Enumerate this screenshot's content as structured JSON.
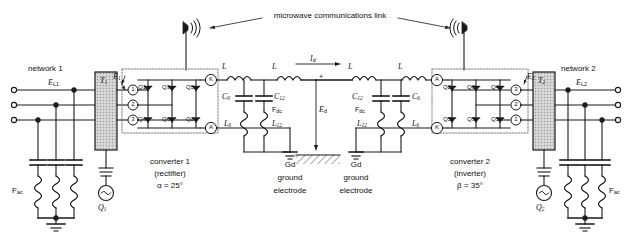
{
  "diagram": {
    "link_label": "microwave communications link"
  },
  "networks": {
    "left": {
      "name": "network 1",
      "line_voltage": "E",
      "line_voltage_sub": "L1",
      "transformer": "T",
      "transformer_sub": "1",
      "converter_voltage": "E",
      "converter_voltage_sub": "1",
      "ac_filter": "F",
      "ac_filter_sub": "ac",
      "source": "Q",
      "source_sub": "1"
    },
    "right": {
      "name": "network 2",
      "line_voltage": "E",
      "line_voltage_sub": "L2",
      "transformer": "T",
      "transformer_sub": "2",
      "converter_voltage": "E",
      "converter_voltage_sub": "2",
      "ac_filter": "F",
      "ac_filter_sub": "ac",
      "source": "Q",
      "source_sub": "2"
    }
  },
  "converters": {
    "left": {
      "name": "converter 1",
      "mode": "(rectifier)",
      "angle": "α = 25°",
      "terminal_top": "K",
      "terminal_bottom": "A",
      "phases": [
        "1",
        "2",
        "3"
      ],
      "thyristors_top": [
        "Q1",
        "Q3",
        "Q5"
      ],
      "thyristors_bottom": [
        "Q4",
        "Q6",
        "Q2"
      ]
    },
    "right": {
      "name": "converter 2",
      "mode": "(inverter)",
      "angle": "β = 35°",
      "terminal_top": "A",
      "terminal_bottom": "K",
      "phases": [
        "3",
        "2",
        "1"
      ],
      "thyristors_top": [
        "Q2",
        "Q6",
        "Q4"
      ],
      "thyristors_bottom": [
        "Q5",
        "Q3",
        "Q1"
      ]
    }
  },
  "dc_line": {
    "current": "I",
    "current_sub": "d",
    "voltage": "E",
    "voltage_sub": "d",
    "polarity": "+",
    "smoothing_inductor": "L",
    "filters_left": {
      "cap_outer": "C",
      "cap_outer_sub": "6",
      "cap_inner": "C",
      "cap_inner_sub": "12",
      "ind_outer": "L",
      "ind_outer_sub": "6",
      "ind_inner": "L",
      "ind_inner_sub": "12",
      "dc_filter_label": "F",
      "dc_filter_sub": "dc"
    },
    "filters_right": {
      "cap_outer": "C",
      "cap_outer_sub": "12",
      "cap_inner": "C",
      "cap_inner_sub": "6",
      "ind_outer": "L",
      "ind_outer_sub": "12",
      "ind_inner": "L",
      "ind_inner_sub": "6",
      "dc_filter_label": "F",
      "dc_filter_sub": "dc"
    }
  },
  "grounds": {
    "left": {
      "symbol": "Gd",
      "line1": "ground",
      "line2": "electrode"
    },
    "right": {
      "symbol": "Gd",
      "line1": "ground",
      "line2": "electrode"
    }
  },
  "colors": {
    "line": "#1a1a1a",
    "text": "#111111",
    "transformer_fill": "#c9c9c9",
    "dashed_box": "#555555",
    "background": "#ffffff"
  }
}
